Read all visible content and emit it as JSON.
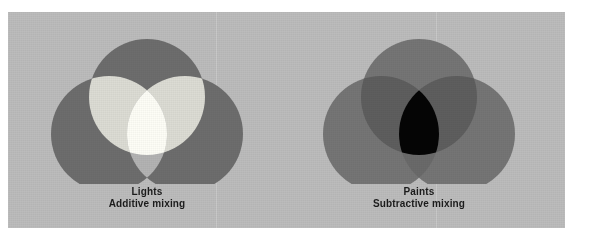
{
  "figure": {
    "plate_color": "#bcbcbc",
    "page_background": "#ffffff",
    "caption_text_color": "#1c1c1c"
  },
  "diagrams": [
    {
      "id": "additive",
      "title": "Lights",
      "subtitle": "Additive mixing",
      "mixing_model": "additive",
      "primary_color": "#6d6d6d",
      "pair_overlap_color": "#dcdcd4",
      "pair_overlap_color_alt": "#b3b3b3",
      "center_color": "#fdfdf6",
      "circles": [
        {
          "name": "top-circle",
          "cx": 139,
          "cy": 85,
          "r": 58
        },
        {
          "name": "bottom-left-circle",
          "cx": 101,
          "cy": 122,
          "r": 58
        },
        {
          "name": "bottom-right-circle",
          "cx": 177,
          "cy": 122,
          "r": 58
        }
      ]
    },
    {
      "id": "subtractive",
      "title": "Paints",
      "subtitle": "Subtractive mixing",
      "mixing_model": "subtractive",
      "primary_color": "#757575",
      "pair_overlap_color": "#5e5e5e",
      "pair_overlap_color_alt": "#6a6a6a",
      "center_color": "#050505",
      "circles": [
        {
          "name": "top-circle",
          "cx": 139,
          "cy": 85,
          "r": 58
        },
        {
          "name": "bottom-left-circle",
          "cx": 101,
          "cy": 122,
          "r": 58
        },
        {
          "name": "bottom-right-circle",
          "cx": 177,
          "cy": 122,
          "r": 58
        }
      ]
    }
  ]
}
